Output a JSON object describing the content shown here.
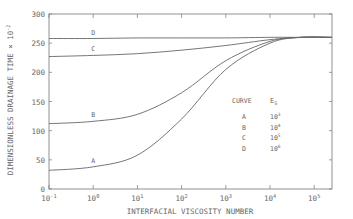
{
  "chart_data": {
    "type": "line",
    "title": "",
    "xlabel": "INTERFACIAL VISCOSITY NUMBER",
    "ylabel": "DIMENSIONLESS DRAINAGE TIME × 10^-2",
    "xscale": "log",
    "xlim": [
      0.1,
      250000
    ],
    "ylim": [
      0,
      300
    ],
    "x_ticks": [
      "10^-1",
      "10^0",
      "10^1",
      "10^2",
      "10^3",
      "10^4",
      "10^5"
    ],
    "y_ticks": [
      0,
      50,
      100,
      150,
      200,
      250,
      300
    ],
    "grid": false,
    "legend": {
      "header": [
        "CURVE",
        "E_S"
      ],
      "position": "inside-right",
      "entries": [
        {
          "curve": "A",
          "value": "10^3"
        },
        {
          "curve": "B",
          "value": "10^4"
        },
        {
          "curve": "C",
          "value": "10^5"
        },
        {
          "curve": "D",
          "value": "10^6"
        }
      ]
    },
    "x": [
      0.1,
      1,
      10,
      100,
      1000,
      10000,
      50000,
      250000
    ],
    "series": [
      {
        "name": "A",
        "values": [
          32,
          38,
          58,
          120,
          205,
          250,
          260,
          260
        ]
      },
      {
        "name": "B",
        "values": [
          112,
          116,
          128,
          165,
          220,
          253,
          260,
          260
        ]
      },
      {
        "name": "C",
        "values": [
          227,
          229,
          232,
          238,
          246,
          256,
          260,
          260
        ]
      },
      {
        "name": "D",
        "values": [
          258,
          258,
          259,
          259,
          259,
          260,
          260,
          260
        ]
      }
    ]
  },
  "labels": {
    "x_axis": "INTERFACIAL VISCOSITY NUMBER",
    "y_axis": "DIMENSIONLESS DRAINAGE TIME × 10",
    "y_axis_exp": "-2",
    "legend_curve": "CURVE",
    "legend_es": "E",
    "legend_es_sub": "S"
  }
}
